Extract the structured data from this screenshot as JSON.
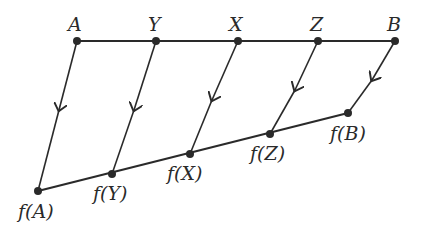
{
  "diagram": {
    "type": "mapping",
    "top_line": {
      "points": [
        {
          "label": "A",
          "x": 77,
          "y": 41
        },
        {
          "label": "Y",
          "x": 156,
          "y": 41
        },
        {
          "label": "X",
          "x": 238,
          "y": 41
        },
        {
          "label": "Z",
          "x": 318,
          "y": 41
        },
        {
          "label": "B",
          "x": 395,
          "y": 41
        }
      ]
    },
    "bottom_line": {
      "points": [
        {
          "label": "f(A)",
          "x": 38,
          "y": 191
        },
        {
          "label": "f(Y)",
          "x": 112,
          "y": 174
        },
        {
          "label": "f(X)",
          "x": 190,
          "y": 154
        },
        {
          "label": "f(Z)",
          "x": 270,
          "y": 134
        },
        {
          "label": "f(B)",
          "x": 348,
          "y": 113
        }
      ]
    },
    "labels": {
      "A": "A",
      "Y": "Y",
      "X": "X",
      "Z": "Z",
      "B": "B",
      "fA": "f(A)",
      "fY": "f(Y)",
      "fX": "f(X)",
      "fZ": "f(Z)",
      "fB": "f(B)"
    },
    "colors": {
      "line": "#2a2a2a",
      "background": "#ffffff"
    }
  }
}
